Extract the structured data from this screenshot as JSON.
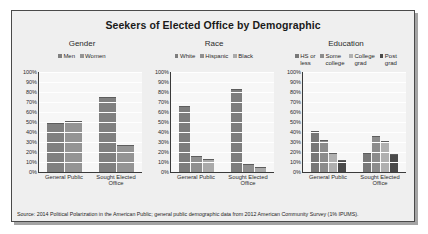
{
  "figure": {
    "title": "Seekers of Elected Office by Demographic",
    "source": "Source: 2014 Political Polarization in the American Public; general public demographic data from 2012 American Community Survey (1% IPUMS)."
  },
  "chart_data": [
    {
      "type": "bar",
      "title": "Gender",
      "categories": [
        "General Public",
        "Sought Elected Office"
      ],
      "series": [
        {
          "name": "Men",
          "values": [
            48,
            74
          ],
          "color": "#808080"
        },
        {
          "name": "Women",
          "values": [
            50,
            26
          ],
          "color": "#949494"
        }
      ],
      "xlabel": "",
      "ylabel": "",
      "ylim": [
        0,
        100
      ],
      "yticks": [
        "100%",
        "90%",
        "80%",
        "70%",
        "60%",
        "50%",
        "40%",
        "30%",
        "20%",
        "10%",
        "0%"
      ],
      "grid": true,
      "legend_position": "top"
    },
    {
      "type": "bar",
      "title": "Race",
      "categories": [
        "General Public",
        "Sought Elected Office"
      ],
      "series": [
        {
          "name": "White",
          "values": [
            65,
            82
          ],
          "color": "#7d7d7d"
        },
        {
          "name": "Hispanic",
          "values": [
            15,
            7
          ],
          "color": "#8f8f8f"
        },
        {
          "name": "Black",
          "values": [
            12,
            4
          ],
          "color": "#aaaaaa"
        }
      ],
      "xlabel": "",
      "ylabel": "",
      "ylim": [
        0,
        100
      ],
      "yticks": [
        "100%",
        "90%",
        "80%",
        "70%",
        "60%",
        "50%",
        "40%",
        "30%",
        "20%",
        "10%",
        "0%"
      ],
      "grid": true,
      "legend_position": "top"
    },
    {
      "type": "bar",
      "title": "Education",
      "categories": [
        "General Public",
        "Sought Elected Office"
      ],
      "series": [
        {
          "name": "HS or\nless",
          "values": [
            40,
            18
          ],
          "color": "#787878"
        },
        {
          "name": "Some\ncollege",
          "values": [
            31,
            35
          ],
          "color": "#8c8c8c"
        },
        {
          "name": "College\ngrad",
          "values": [
            18,
            30
          ],
          "color": "#b0b0b0"
        },
        {
          "name": "Post\ngrad",
          "values": [
            11,
            17
          ],
          "color": "#4a4a4a"
        }
      ],
      "xlabel": "",
      "ylabel": "",
      "ylim": [
        0,
        100
      ],
      "yticks": [
        "100%",
        "90%",
        "80%",
        "70%",
        "60%",
        "50%",
        "40%",
        "30%",
        "20%",
        "10%",
        "0%"
      ],
      "grid": true,
      "legend_position": "top"
    }
  ],
  "xtick_labels": [
    "General Public",
    "Sought Elected\nOffice"
  ]
}
